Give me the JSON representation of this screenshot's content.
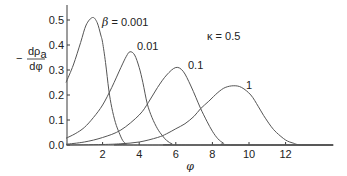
{
  "chart_data": {
    "type": "line",
    "title": "",
    "xlabel": "φ",
    "ylabel": "−dρa/dφ",
    "xlim": [
      0,
      14.6
    ],
    "ylim": [
      0,
      0.55
    ],
    "grid": false,
    "legend": "inline labels on curves",
    "xticks": [
      2,
      4,
      6,
      8,
      10,
      12
    ],
    "xtick_labels": [
      "2",
      "4",
      "6",
      "8",
      "10",
      "12"
    ],
    "yticks": [
      0.0,
      0.1,
      0.2,
      0.3,
      0.4,
      0.5
    ],
    "ytick_labels": [
      "0.0",
      "0.1",
      "0.2",
      "0.3",
      "0.4",
      "0.5"
    ],
    "annotations": {
      "kappa": "κ = 0.5",
      "beta_prefix": "β",
      "beta_first": " = 0.001",
      "beta_2": "0.01",
      "beta_3": "0.1",
      "beta_4": "1"
    },
    "series": [
      {
        "name": "β = 0.001",
        "x": [
          0,
          0.4,
          0.8,
          1.1,
          1.45,
          1.7,
          1.9,
          2.0,
          2.16,
          2.34,
          2.5,
          2.7,
          2.9,
          3.1,
          3.3,
          3.5,
          14.6
        ],
        "y": [
          0.25,
          0.32,
          0.41,
          0.48,
          0.51,
          0.49,
          0.44,
          0.41,
          0.33,
          0.22,
          0.15,
          0.09,
          0.05,
          0.018,
          0.004,
          0,
          0
        ]
      },
      {
        "name": "β = 0.01",
        "x": [
          0,
          0.5,
          1.0,
          1.5,
          2.0,
          2.5,
          3.0,
          3.3,
          3.5,
          3.75,
          4.0,
          4.2,
          4.44,
          4.7,
          5.0,
          5.26,
          5.5,
          5.8,
          6.0,
          14.6
        ],
        "y": [
          0.027,
          0.045,
          0.07,
          0.11,
          0.16,
          0.23,
          0.31,
          0.355,
          0.373,
          0.36,
          0.31,
          0.25,
          0.165,
          0.11,
          0.065,
          0.038,
          0.018,
          0.004,
          0,
          0
        ]
      },
      {
        "name": "β = 0.1",
        "x": [
          0,
          1,
          2,
          3,
          4,
          4.5,
          5,
          5.5,
          6.0,
          6.4,
          6.8,
          7.1,
          7.35,
          7.7,
          8.0,
          8.3,
          8.6,
          9.0,
          14.6
        ],
        "y": [
          0.003,
          0.012,
          0.03,
          0.06,
          0.12,
          0.17,
          0.23,
          0.28,
          0.31,
          0.295,
          0.24,
          0.19,
          0.147,
          0.095,
          0.055,
          0.025,
          0.008,
          0,
          0
        ]
      },
      {
        "name": "β = 1",
        "x": [
          0,
          2,
          3,
          4,
          5,
          5.5,
          6,
          6.5,
          7,
          7.35,
          7.8,
          8.3,
          8.7,
          9.17,
          9.6,
          10.1,
          10.5,
          10.8,
          11.2,
          11.5,
          12,
          12.4,
          12.9,
          14.6
        ],
        "y": [
          0,
          0.002,
          0.005,
          0.012,
          0.03,
          0.045,
          0.065,
          0.085,
          0.115,
          0.145,
          0.175,
          0.21,
          0.23,
          0.237,
          0.23,
          0.2,
          0.155,
          0.118,
          0.075,
          0.05,
          0.02,
          0.008,
          0,
          0
        ]
      }
    ]
  },
  "axis_labels": {
    "y_minus": "−",
    "y_num_d": "dρ",
    "y_num_sub": "a",
    "y_den": "dφ",
    "x": "φ"
  },
  "colors": {
    "curve": "#555555",
    "axis": "#3a3a3a",
    "text": "#222222"
  }
}
